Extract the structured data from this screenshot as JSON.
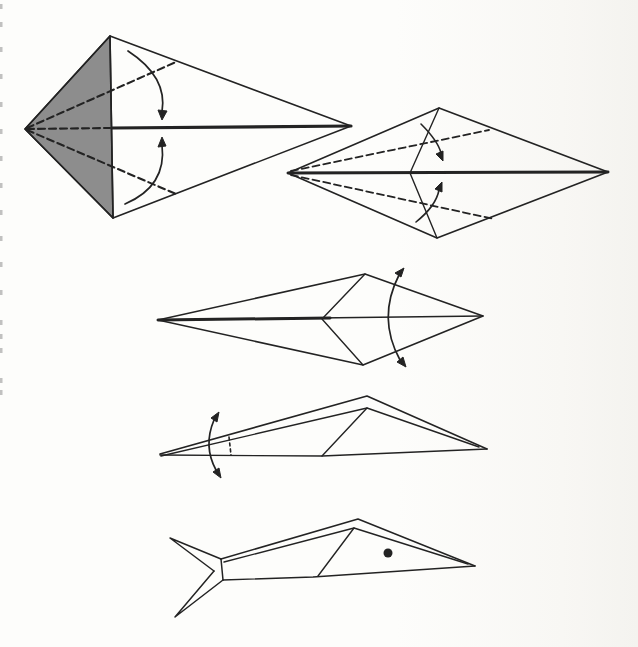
{
  "document": {
    "kind": "scanned-origami-instruction-diagram",
    "subject": "origami fish folding sequence",
    "step_count": 5
  },
  "colors": {
    "paper": "#fdfdfb",
    "ink": "#232323",
    "shade": "#8d8d8d",
    "edge_mark": "#8f8f8f"
  },
  "edge_marks": {
    "x": 0,
    "ys": [
      4,
      22,
      47,
      74,
      102,
      129,
      156,
      183,
      210,
      236,
      262,
      290,
      320,
      334,
      348,
      378,
      390
    ]
  },
  "figures": [
    {
      "name": "step-1-kite-base",
      "shapes": [
        {
          "kind": "fill",
          "name": "shaded-face",
          "d": "M 25 129 L 110 36 L 113 218 Z",
          "fill": "shade",
          "w": 1.6
        },
        {
          "kind": "path",
          "name": "outline",
          "d": "M 25 129 L 110 36 L 351 126 L 113 218 Z",
          "w": 1.6
        },
        {
          "kind": "path",
          "name": "vertical-crease",
          "d": "M 110 36 L 113 218",
          "w": 1.6
        },
        {
          "kind": "path",
          "name": "center-crease-thick",
          "d": "M 112 128 L 351 126",
          "w": 3.2
        },
        {
          "kind": "dash",
          "name": "valley-fold-dash-upper",
          "d": "M 27 128 L 176 62",
          "w": 2.1
        },
        {
          "kind": "dash",
          "name": "valley-fold-dash-center",
          "d": "M 27 129 L 110 128",
          "w": 2.1
        },
        {
          "kind": "dash",
          "name": "valley-fold-dash-lower",
          "d": "M 27 130 L 176 194",
          "w": 2.1
        },
        {
          "kind": "path",
          "name": "fold-arrow-curve-upper",
          "d": "M 128 51 Q 168 77 162 112",
          "w": 1.7
        },
        {
          "kind": "head",
          "name": "fold-arrow-head-upper",
          "pts": "162 120 158 110 167 111"
        },
        {
          "kind": "path",
          "name": "fold-arrow-curve-lower",
          "d": "M 125 204 Q 167 186 162 145",
          "w": 1.7
        },
        {
          "kind": "head",
          "name": "fold-arrow-head-lower",
          "pts": "162 137 158 147 166 146"
        }
      ]
    },
    {
      "name": "step-2-flattened-diamond",
      "shapes": [
        {
          "kind": "path",
          "name": "outline",
          "d": "M 288 173 L 439 108 L 608 172 L 437 238 Z",
          "w": 1.6
        },
        {
          "kind": "path",
          "name": "center-crease-thick",
          "d": "M 288 173 L 608 172",
          "w": 3
        },
        {
          "kind": "path",
          "name": "flap-crease",
          "d": "M 439 108 L 410 173 L 437 238",
          "w": 1.4
        },
        {
          "kind": "dash",
          "name": "valley-fold-dash-upper",
          "d": "M 291 171 L 489 130",
          "w": 1.8
        },
        {
          "kind": "dash",
          "name": "valley-fold-dash-lower",
          "d": "M 291 175 L 494 219",
          "w": 1.8
        },
        {
          "kind": "path",
          "name": "fold-arrow-curve-upper",
          "d": "M 421 124 Q 438 141 441 153",
          "w": 1.6
        },
        {
          "kind": "head",
          "name": "fold-arrow-head-upper",
          "pts": "443 161 436 154 443 151"
        },
        {
          "kind": "path",
          "name": "fold-arrow-curve-lower",
          "d": "M 416 222 Q 436 206 439 190",
          "w": 1.6
        },
        {
          "kind": "head",
          "name": "fold-arrow-head-lower",
          "pts": "442 182 442 192 435 189"
        }
      ]
    },
    {
      "name": "step-3-slender-kite",
      "shapes": [
        {
          "kind": "path",
          "name": "outline",
          "d": "M 158 320 L 365 274 L 483 316 L 363 365 Z",
          "w": 1.6
        },
        {
          "kind": "path",
          "name": "flap-crease",
          "d": "M 365 274 L 322 319 L 363 365",
          "w": 1.4
        },
        {
          "kind": "path",
          "name": "center-crease",
          "d": "M 158 320 L 483 316",
          "w": 1.4
        },
        {
          "kind": "path",
          "name": "center-crease-thick",
          "d": "M 158 320 L 330 318",
          "w": 3
        },
        {
          "kind": "path",
          "name": "fold-arrow-curve",
          "d": "M 399 275 Q 377 318 400 360",
          "w": 1.7
        },
        {
          "kind": "head",
          "name": "fold-arrow-head-upper",
          "pts": "404 268 401 277 395 273"
        },
        {
          "kind": "head",
          "name": "fold-arrow-head-lower",
          "pts": "406 367 397 362 403 357"
        }
      ]
    },
    {
      "name": "step-4-folded-flat",
      "shapes": [
        {
          "kind": "path",
          "name": "outer-top-edge",
          "d": "M 160 454 L 367 396 L 487 449",
          "w": 1.6
        },
        {
          "kind": "path",
          "name": "inner-top-edge",
          "d": "M 161 456 L 367 408 L 479 447",
          "w": 1.4
        },
        {
          "kind": "path",
          "name": "flap-crease",
          "d": "M 367 408 L 322 456",
          "w": 1.4
        },
        {
          "kind": "path",
          "name": "bottom-edge",
          "d": "M 160 455 L 322 456 L 487 449",
          "w": 1.4
        },
        {
          "kind": "dash",
          "name": "valley-fold-dash-nose",
          "d": "M 229 437 L 231 455",
          "w": 1.6,
          "da": "3 3"
        },
        {
          "kind": "path",
          "name": "fold-arrow-curve",
          "d": "M 214 420 Q 203 446 216 470",
          "w": 1.7
        },
        {
          "kind": "head",
          "name": "fold-arrow-head-upper",
          "pts": "219 412 217 422 211 418"
        },
        {
          "kind": "head",
          "name": "fold-arrow-head-lower",
          "pts": "221 478 213 472 219 468"
        }
      ]
    },
    {
      "name": "step-5-finished-fish",
      "shapes": [
        {
          "kind": "path",
          "name": "tail-fin-upper",
          "d": "M 221 559 L 170 538 L 214 571",
          "w": 1.5
        },
        {
          "kind": "path",
          "name": "tail-fin-lower",
          "d": "M 214 571 L 175 617 L 223 580",
          "w": 1.5
        },
        {
          "kind": "path",
          "name": "tail-joint",
          "d": "M 221 559 L 223 580",
          "w": 1.5
        },
        {
          "kind": "path",
          "name": "body-outer-top-edge",
          "d": "M 221 559 L 358 519 L 475 566",
          "w": 1.5
        },
        {
          "kind": "path",
          "name": "body-inner-top-edge",
          "d": "M 224 562 L 354 528 L 468 564",
          "w": 1.4
        },
        {
          "kind": "path",
          "name": "body-crease",
          "d": "M 354 528 L 318 576",
          "w": 1.4
        },
        {
          "kind": "path",
          "name": "body-bottom-edge",
          "d": "M 223 580 L 313 577 L 475 566",
          "w": 1.4
        },
        {
          "kind": "dot",
          "name": "fish-eye-dot",
          "cx": 388,
          "cy": 553,
          "r": 4.5
        }
      ]
    }
  ]
}
